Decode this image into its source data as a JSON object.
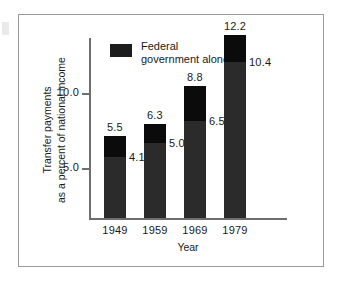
{
  "figure": {
    "background_color": "#ffffff",
    "frame_color": "#9a9a9a",
    "axis_color": "#6e6e6e"
  },
  "legend": {
    "swatch_color": "#1d1d1d",
    "line1": "Federal",
    "line2": "government alone"
  },
  "axis": {
    "y_title_line1": "Transfer payments",
    "y_title_line2": "as a percent of national income",
    "x_title": "Year",
    "y_ticks": [
      "10.0",
      "5.0"
    ]
  },
  "chart_data": {
    "type": "bar",
    "title": "",
    "xlabel": "Year",
    "ylabel": "Transfer payments as a percent of national income",
    "categories": [
      "1949",
      "1959",
      "1969",
      "1979"
    ],
    "ylim": [
      0,
      13.5
    ],
    "yticks": [
      5.0,
      10.0
    ],
    "grid": false,
    "legend_position": "top-left",
    "stacked": true,
    "series": [
      {
        "name": "Federal government alone",
        "color": "#2b2b2b",
        "values": [
          4.1,
          5.0,
          6.5,
          10.4
        ],
        "labels": [
          "4.1",
          "5.0",
          "6.5",
          "10.4"
        ]
      },
      {
        "name": "Total transfer payments",
        "color": "#0b0b0b",
        "values": [
          5.5,
          6.3,
          8.8,
          12.2
        ],
        "labels": [
          "5.5",
          "6.3",
          "8.8",
          "12.2"
        ]
      }
    ],
    "bars": [
      {
        "category": "1949",
        "total": 5.5,
        "federal": 4.1,
        "total_label": "5.5",
        "federal_label": "4.1"
      },
      {
        "category": "1959",
        "total": 6.3,
        "federal": 5.0,
        "total_label": "6.3",
        "federal_label": "5.0"
      },
      {
        "category": "1969",
        "total": 8.8,
        "federal": 6.5,
        "total_label": "8.8",
        "federal_label": "6.5"
      },
      {
        "category": "1979",
        "total": 12.2,
        "federal": 10.4,
        "total_label": "12.2",
        "federal_label": "10.4"
      }
    ]
  }
}
